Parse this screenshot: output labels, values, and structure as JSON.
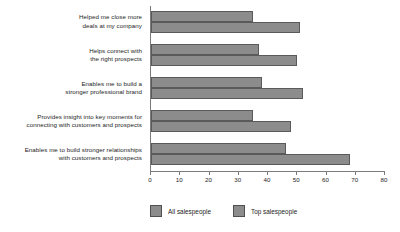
{
  "chart_data": {
    "type": "bar",
    "orientation": "horizontal",
    "title": "",
    "xlabel": "",
    "ylabel": "",
    "xlim": [
      0,
      80
    ],
    "xticks": [
      0,
      10,
      20,
      30,
      40,
      50,
      60,
      70,
      80
    ],
    "grid": false,
    "legend_position": "bottom",
    "categories": [
      "Helped me close more\ndeals at my company",
      "Helps connect with\nthe right prospects",
      "Enables me to build a\nstronger professional brand",
      "Provides insight into key moments for\nconnecting with customers and prospects",
      "Enables me to build stronger relationships\nwith customers and prospects"
    ],
    "category_lines": [
      [
        "Helped me close more",
        "deals at my company"
      ],
      [
        "Helps connect with",
        "the right prospects"
      ],
      [
        "Enables me to build a",
        "stronger professional brand"
      ],
      [
        "Provides insight into key moments for",
        "connecting with customers and prospects"
      ],
      [
        "Enables me to build stronger relationships",
        "with customers and prospects"
      ]
    ],
    "series": [
      {
        "name": "All salespeople",
        "color": "#8c8c8c",
        "values": [
          35,
          37,
          38,
          35,
          46
        ]
      },
      {
        "name": "Top salespeople",
        "color": "#8c8c8c",
        "values": [
          51,
          50,
          52,
          48,
          68
        ]
      }
    ]
  },
  "legend": {
    "items": [
      {
        "label": "All salespeople",
        "swatch_color": "#8c8c8c"
      },
      {
        "label": "Top salespeople",
        "swatch_color": "#8c8c8c"
      }
    ]
  },
  "axis": {
    "tick_labels": [
      "0",
      "10",
      "20",
      "30",
      "40",
      "50",
      "60",
      "70",
      "80"
    ]
  }
}
